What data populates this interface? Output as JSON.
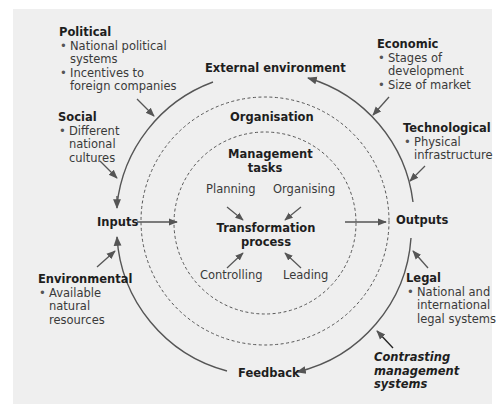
{
  "diagram": {
    "core": {
      "external_environment": "External environment",
      "organisation": "Organisation",
      "management_tasks": [
        "Management",
        "tasks"
      ],
      "transformation_process": [
        "Transformation",
        "process"
      ],
      "inputs": "Inputs",
      "outputs": "Outputs",
      "feedback": "Feedback"
    },
    "tasks": {
      "planning": "Planning",
      "organising": "Organising",
      "controlling": "Controlling",
      "leading": "Leading"
    },
    "factors": {
      "political": {
        "title": "Political",
        "bullets": [
          [
            "National political",
            "systems"
          ],
          [
            "Incentives to",
            "foreign companies"
          ]
        ]
      },
      "social": {
        "title": "Social",
        "bullets": [
          [
            "Different",
            "national",
            "cultures"
          ]
        ]
      },
      "environmental": {
        "title": "Environmental",
        "bullets": [
          [
            "Available",
            "natural",
            "resources"
          ]
        ]
      },
      "economic": {
        "title": "Economic",
        "bullets": [
          [
            "Stages of",
            "development"
          ],
          [
            "Size of market"
          ]
        ]
      },
      "technological": {
        "title": "Technological",
        "bullets": [
          [
            "Physical",
            "infrastructure"
          ]
        ]
      },
      "legal": {
        "title": "Legal",
        "bullets": [
          [
            "National and",
            "international",
            "legal systems"
          ]
        ]
      }
    },
    "contrasting": [
      "Contrasting",
      "management",
      "systems"
    ],
    "colors": {
      "background": "#efefef",
      "line": "#555555",
      "text": "#1e1e1e"
    }
  }
}
